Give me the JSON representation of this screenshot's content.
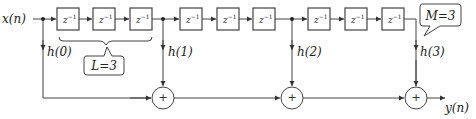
{
  "diagram": {
    "type": "polyphase/FIR filter block diagram",
    "input_label": "x(n)",
    "output_label": "y(n)",
    "delay_symbol": "z",
    "delay_exponent": "−1",
    "delay_groups": 3,
    "delays_per_group": 3,
    "coefficients": [
      "h(0)",
      "h(1)",
      "h(2)",
      "h(3)"
    ],
    "adder_symbol": "+",
    "callouts": {
      "L": "L=3",
      "M": "M=3"
    }
  }
}
